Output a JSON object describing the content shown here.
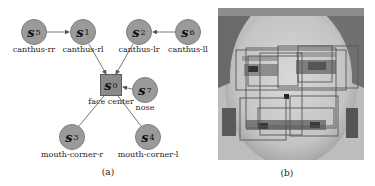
{
  "panel_a": {
    "caption": "(a)",
    "nodes": [
      {
        "id": "s0",
        "sym": "s",
        "sub": "0",
        "label": "face center",
        "shape": "square"
      },
      {
        "id": "s1",
        "sym": "s",
        "sub": "1",
        "label": "canthus-rl",
        "shape": "circle"
      },
      {
        "id": "s2",
        "sym": "s",
        "sub": "2",
        "label": "canthus-lr",
        "shape": "circle"
      },
      {
        "id": "s3",
        "sym": "s",
        "sub": "3",
        "label": "mouth-corner-r",
        "shape": "circle"
      },
      {
        "id": "s4",
        "sym": "s",
        "sub": "4",
        "label": "mouth-corner-l",
        "shape": "circle"
      },
      {
        "id": "s5",
        "sym": "s",
        "sub": "5",
        "label": "canthus-rr",
        "shape": "circle"
      },
      {
        "id": "s6",
        "sym": "s",
        "sub": "6",
        "label": "canthus-ll",
        "shape": "circle"
      },
      {
        "id": "s7",
        "sym": "s",
        "sub": "7",
        "label": "nose",
        "shape": "circle"
      }
    ],
    "edges": [
      {
        "from": "s5",
        "to": "s1",
        "directed": true
      },
      {
        "from": "s6",
        "to": "s2",
        "directed": true
      },
      {
        "from": "s1",
        "to": "s0",
        "directed": true
      },
      {
        "from": "s2",
        "to": "s0",
        "directed": true
      },
      {
        "from": "s7",
        "to": "s0",
        "directed": true
      },
      {
        "from": "s0",
        "to": "s3",
        "directed": false
      },
      {
        "from": "s0",
        "to": "s4",
        "directed": false
      }
    ]
  },
  "panel_b": {
    "caption": "(b)",
    "description": "grayscale low-resolution face image with overlaid part bounding boxes",
    "center_marker": "s0"
  }
}
